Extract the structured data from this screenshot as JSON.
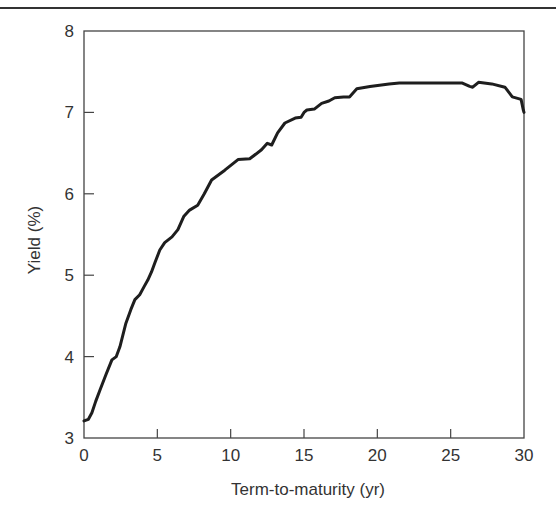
{
  "chart_data": {
    "type": "line",
    "title": "",
    "xlabel": "Term-to-maturity (yr)",
    "ylabel": "Yield (%)",
    "xlim": [
      0,
      30
    ],
    "ylim": [
      3,
      8
    ],
    "xticks": [
      0,
      5,
      10,
      15,
      20,
      25,
      30
    ],
    "yticks": [
      3,
      4,
      5,
      6,
      7,
      8
    ],
    "grid": false,
    "legend": null,
    "series": [
      {
        "name": "Yield curve",
        "color": "#1e1e1e",
        "x": [
          0,
          0.3,
          0.54,
          0.8,
          1.09,
          1.5,
          1.9,
          2.2,
          2.45,
          2.86,
          3.2,
          3.47,
          3.8,
          4.1,
          4.35,
          4.6,
          4.83,
          5.17,
          5.5,
          6.0,
          6.4,
          6.8,
          7.2,
          7.75,
          8.2,
          8.7,
          9.6,
          10.5,
          11.3,
          12.1,
          12.5,
          12.8,
          13.2,
          13.7,
          14.4,
          14.8,
          15.0,
          15.2,
          15.7,
          16.2,
          16.7,
          17.1,
          17.7,
          18.1,
          18.6,
          19.5,
          20.8,
          21.5,
          22.9,
          24.2,
          25.8,
          26.3,
          26.5,
          26.9,
          27.8,
          28.7,
          29.0,
          29.2,
          29.8,
          29.95,
          30.0
        ],
        "y": [
          3.21,
          3.23,
          3.31,
          3.45,
          3.59,
          3.78,
          3.96,
          4.0,
          4.12,
          4.41,
          4.58,
          4.7,
          4.76,
          4.86,
          4.94,
          5.04,
          5.15,
          5.31,
          5.4,
          5.47,
          5.56,
          5.72,
          5.8,
          5.86,
          6.0,
          6.17,
          6.29,
          6.42,
          6.43,
          6.54,
          6.62,
          6.6,
          6.75,
          6.87,
          6.93,
          6.94,
          7.0,
          7.03,
          7.04,
          7.11,
          7.14,
          7.18,
          7.19,
          7.19,
          7.29,
          7.32,
          7.35,
          7.36,
          7.36,
          7.36,
          7.36,
          7.32,
          7.31,
          7.37,
          7.35,
          7.31,
          7.24,
          7.19,
          7.16,
          7.03,
          7.0
        ]
      }
    ]
  },
  "layout": {
    "plot_left": 84,
    "plot_right": 524,
    "plot_top": 31,
    "plot_bottom": 438
  }
}
